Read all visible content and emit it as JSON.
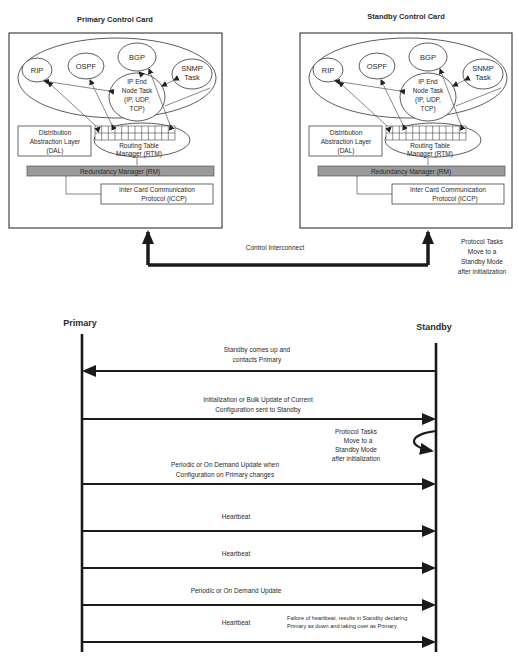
{
  "top_diagram": {
    "primary_card": {
      "title": "Primary Control Card",
      "tasks": {
        "rip": "RIP",
        "ospf": "OSPF",
        "bgp": "BGP",
        "snmp_line1": "SNMP",
        "snmp_line2": "Task",
        "ip_line1": "IP End",
        "ip_line2": "Node Task",
        "ip_line3": "(IP, UDP,",
        "ip_line4": "TCP)"
      },
      "dal_line1": "Distribution",
      "dal_line2": "Abstraction Layer",
      "dal_line3": "(DAL)",
      "rtm_line1": "Routing Table",
      "rtm_line2": "Manager (RTM)",
      "rm": "Redundancy Manager (RM)",
      "iccp_line1": "Inter Card Communication",
      "iccp_line2": "Protocol (ICCP)"
    },
    "standby_card": {
      "title": "Standby Control Card",
      "tasks": {
        "rip": "RIP",
        "ospf": "OSPF",
        "bgp": "BGP",
        "snmp_line1": "SNMP",
        "snmp_line2": "Task",
        "ip_line1": "IP End",
        "ip_line2": "Node Task",
        "ip_line3": "(IP, UDP,",
        "ip_line4": "TCP)"
      },
      "dal_line1": "Distribution",
      "dal_line2": "Abstraction Layer",
      "dal_line3": "(DAL)",
      "rtm_line1": "Routing Table",
      "rtm_line2": "Manager (RTM)",
      "rm": "Redundancy Manager (RM)",
      "iccp_line1": "Inter Card Communication",
      "iccp_line2": "Protocol (ICCP)"
    },
    "interconnect_label": "Control Interconnect",
    "standby_note": [
      "Protocol Tasks",
      "Move to a",
      "Standby Mode",
      "after initialization"
    ]
  },
  "sequence": {
    "primary_label": "Primary",
    "standby_label": "Standby",
    "messages": [
      {
        "direction": "standby-to-primary",
        "lines": [
          "Standby comes up and",
          "contacts Primary"
        ]
      },
      {
        "direction": "primary-to-standby",
        "lines": [
          "Initialization or Bulk Update of Current",
          "Configuration sent to Standby"
        ]
      },
      {
        "direction": "self-standby",
        "lines": [
          "Protocol Tasks",
          "Move to a",
          "Standby Mode",
          "after initialization"
        ]
      },
      {
        "direction": "primary-to-standby",
        "lines": [
          "Periodic or On Demand Update when",
          "Configuration on Primary changes"
        ]
      },
      {
        "direction": "primary-to-standby",
        "lines": [
          "Heartbeat"
        ]
      },
      {
        "direction": "primary-to-standby",
        "lines": [
          "Heartbeat"
        ]
      },
      {
        "direction": "primary-to-standby",
        "lines": [
          "Periodic or On Demand Update"
        ]
      },
      {
        "direction": "primary-to-standby",
        "lines": [
          "Heartbeat"
        ]
      }
    ],
    "failure_note": [
      "Failure of heartbeat, results in Standby declaring",
      "Primary as down and taking over as Primary"
    ]
  }
}
